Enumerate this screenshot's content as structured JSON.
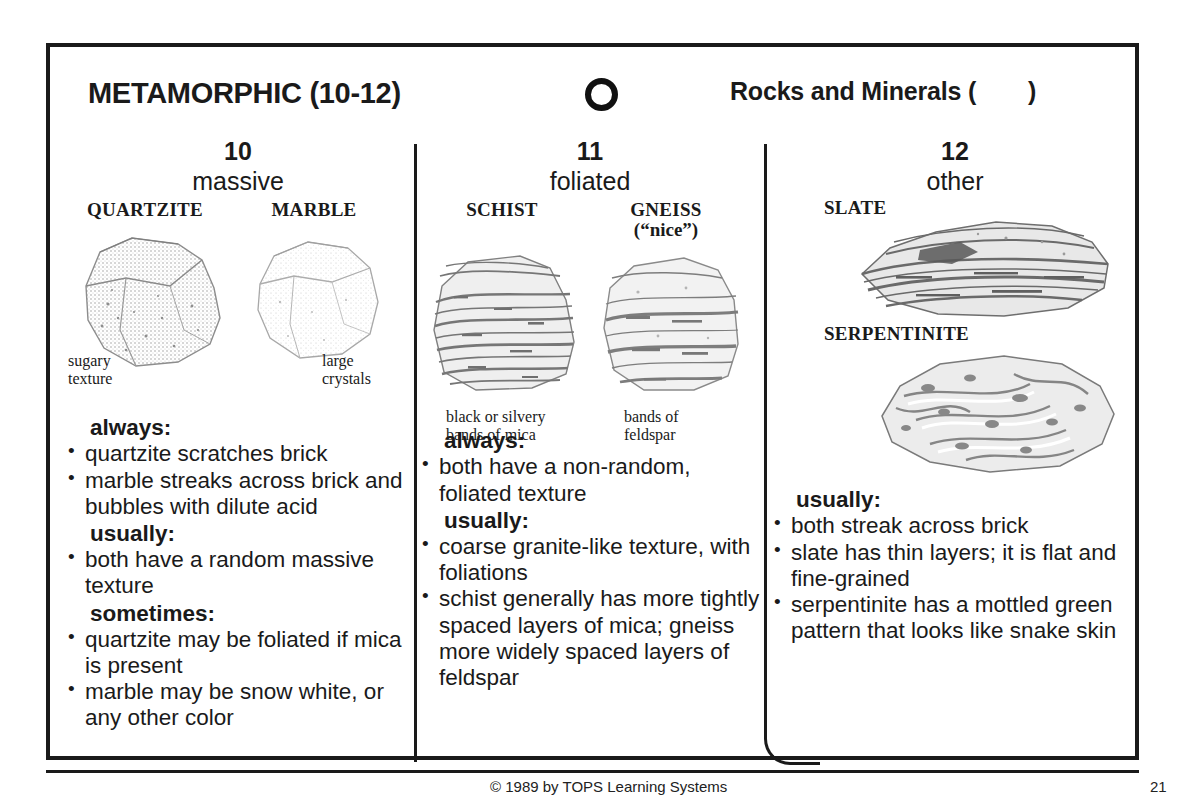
{
  "header": {
    "main_title": "METAMORPHIC (10-12)",
    "circle_icon": "open-circle-icon",
    "series_title_before": "Rocks and Minerals (",
    "series_title_after": ")"
  },
  "columns": [
    {
      "number": "10",
      "subtitle": "massive",
      "specimens": [
        {
          "name": "QUARTZITE",
          "caption": "sugary\ntexture"
        },
        {
          "name": "MARBLE",
          "caption": "large\ncrystals"
        }
      ],
      "sections": [
        {
          "heading": "always:",
          "items": [
            "quartzite scratches brick",
            "marble streaks across brick and bubbles with dilute acid"
          ]
        },
        {
          "heading": "usually:",
          "items": [
            "both have a random massive texture"
          ]
        },
        {
          "heading": "sometimes:",
          "items": [
            "quartzite may be foliated if mica is present",
            "marble may be snow white, or any other color"
          ]
        }
      ]
    },
    {
      "number": "11",
      "subtitle": "foliated",
      "specimens": [
        {
          "name": "SCHIST",
          "sub": "",
          "caption": "black or silvery\nbands of mica"
        },
        {
          "name": "GNEISS",
          "sub": "(“nice”)",
          "caption": "bands of\nfeldspar"
        }
      ],
      "sections": [
        {
          "heading": "always:",
          "items": [
            "both have a non-random, foliated texture"
          ]
        },
        {
          "heading": "usually:",
          "items": [
            "coarse granite-like texture, with foliations",
            "schist generally has more tightly spaced layers of mica; gneiss more widely spaced layers of feldspar"
          ]
        }
      ]
    },
    {
      "number": "12",
      "subtitle": "other",
      "specimens": [
        {
          "name": "SLATE"
        },
        {
          "name": "SERPENTINITE"
        }
      ],
      "sections": [
        {
          "heading": "usually:",
          "items": [
            "both streak across brick",
            "slate has thin layers; it is flat and fine-grained",
            "serpentinite has a mottled green pattern that looks like snake skin"
          ]
        }
      ]
    }
  ],
  "footer": {
    "copyright": "© 1989 by TOPS Learning Systems",
    "page_number": "21"
  },
  "bullet": "•"
}
